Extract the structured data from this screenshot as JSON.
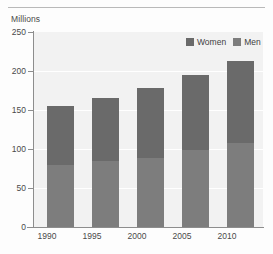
{
  "chart_data": {
    "type": "bar",
    "subtype": "stacked-bar",
    "title": "",
    "xlabel": "",
    "ylabel": "Millions",
    "ylim": [
      0,
      250
    ],
    "yticks": [
      0,
      50,
      100,
      150,
      200,
      250
    ],
    "grid": true,
    "legend_position": "top-right",
    "categories": [
      "1990",
      "1995",
      "2000",
      "2005",
      "2010"
    ],
    "series": [
      {
        "name": "Men",
        "values": [
          80,
          84,
          89,
          99,
          108
        ],
        "color": "#7d7d7d"
      },
      {
        "name": "Women",
        "values": [
          75,
          81,
          89,
          96,
          105
        ],
        "color": "#6a6a6a"
      }
    ],
    "totals": [
      155,
      165,
      178,
      195,
      213
    ]
  },
  "axis": {
    "unit_label": "Millions",
    "y_tick_labels": [
      "250",
      "200",
      "150",
      "100",
      "50",
      "0"
    ],
    "x_tick_labels": [
      "1990",
      "1995",
      "2000",
      "2005",
      "2010"
    ]
  },
  "legend": {
    "items": [
      {
        "label": "Women",
        "color": "#6a6a6a"
      },
      {
        "label": "Men",
        "color": "#7d7d7d"
      }
    ]
  }
}
